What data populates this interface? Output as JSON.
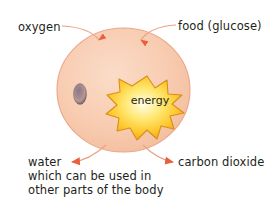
{
  "diagram": {
    "cell": {
      "name": "cell-body",
      "fill_outer": "#f7c6ab",
      "fill_inner": "#fbd9c4",
      "stroke": "#e8a183"
    },
    "nucleus": {
      "name": "nucleus",
      "fill": "#7a6478",
      "stroke": "#5f4a5e"
    },
    "energy_burst": {
      "label": "energy",
      "fill_center": "#fff9c4",
      "fill_mid": "#ffd83d",
      "fill_edge": "#f5a623",
      "stroke": "#c47a12"
    },
    "arrow_color": "#e8603c",
    "leader_color": "#e8a183"
  },
  "labels": {
    "oxygen": "oxygen",
    "food": "food (glucose)",
    "water": "water",
    "carbon_dioxide": "carbon dioxide",
    "energy": "energy"
  },
  "note": {
    "line1": "which can be used in",
    "line2": "other parts of the body"
  }
}
